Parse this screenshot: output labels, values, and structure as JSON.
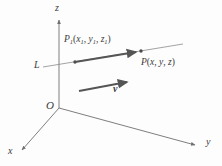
{
  "figure": {
    "background_color": "#fdfdfd",
    "stroke_color": "#6f6f6f",
    "bold_stroke_color": "#555555",
    "text_color": "#3a3a3a"
  },
  "axes": {
    "z": {
      "label": "z",
      "origin": [
        59,
        108
      ],
      "tip": [
        59,
        18
      ]
    },
    "y": {
      "label": "y",
      "origin": [
        59,
        108
      ],
      "tip": [
        197,
        146
      ]
    },
    "x": {
      "label": "x",
      "origin": [
        59,
        108
      ],
      "tip": [
        20,
        152
      ]
    }
  },
  "origin": {
    "label": "O",
    "position": [
      59,
      108
    ]
  },
  "line": {
    "label": "L",
    "start": [
      43,
      67
    ],
    "end": [
      183,
      44
    ]
  },
  "points": {
    "p1": {
      "symbol": "P",
      "subscript": "1",
      "coords": [
        "x",
        "y",
        "z"
      ],
      "coord_subscripts": [
        "1",
        "1",
        "1"
      ],
      "text": "P1(x1, y1, z1)",
      "position": [
        75,
        62
      ]
    },
    "p": {
      "symbol": "P",
      "coords": [
        "x",
        "y",
        "z"
      ],
      "text": "P(x, y, z)",
      "position": [
        140,
        52
      ]
    }
  },
  "vectors": {
    "p1_to_p": {
      "start": [
        75,
        62
      ],
      "end": [
        140,
        52
      ]
    },
    "v": {
      "label": "v",
      "start": [
        79,
        91
      ],
      "end": [
        131,
        82
      ]
    }
  },
  "punctuation": {
    "open_paren": "(",
    "close_paren": ")",
    "comma": ","
  }
}
